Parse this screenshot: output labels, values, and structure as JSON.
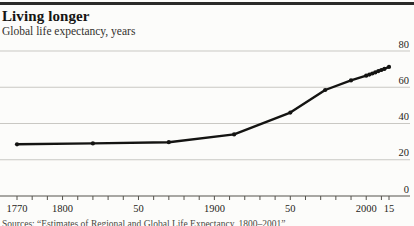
{
  "header": {
    "title": "Living longer",
    "subtitle": "Global life expectancy, years"
  },
  "source": {
    "text": "Sources: “Estimates of Regional and Global Life Expectancy, 1800–2001”"
  },
  "chart_data": {
    "type": "line",
    "title": "Living longer",
    "subtitle": "Global life expectancy, years",
    "xlabel": "year",
    "ylabel": "life expectancy, years",
    "xlim": [
      1770,
      2015
    ],
    "ylim": [
      0,
      80
    ],
    "grid": "horizontal",
    "legend": "none",
    "ytick_side": "right",
    "yticks": [
      0,
      20,
      40,
      60,
      80
    ],
    "xtick_labels": [
      {
        "year": 1770,
        "label": "1770"
      },
      {
        "year": 1800,
        "label": "1800"
      },
      {
        "year": 1850,
        "label": "50"
      },
      {
        "year": 1900,
        "label": "1900"
      },
      {
        "year": 1950,
        "label": "50"
      },
      {
        "year": 2000,
        "label": "2000"
      },
      {
        "year": 2015,
        "label": "15"
      }
    ],
    "x_minor_tick_step_years": 10,
    "series": [
      {
        "name": "Global life expectancy",
        "points": [
          [
            1770,
            28.5
          ],
          [
            1820,
            29.0
          ],
          [
            1870,
            29.7
          ],
          [
            1913,
            34.0
          ],
          [
            1950,
            46.0
          ],
          [
            1973,
            58.5
          ],
          [
            1990,
            63.8
          ],
          [
            2000,
            66.4
          ],
          [
            2002,
            67.0
          ],
          [
            2004,
            67.6
          ],
          [
            2006,
            68.2
          ],
          [
            2008,
            68.9
          ],
          [
            2010,
            69.5
          ],
          [
            2012,
            70.1
          ],
          [
            2015,
            71.2
          ]
        ]
      }
    ],
    "colors": {
      "line": "#141412",
      "grid": "#c9c8c3",
      "axis": "#55534d",
      "tick": "#55534d",
      "label": "#262420"
    }
  }
}
